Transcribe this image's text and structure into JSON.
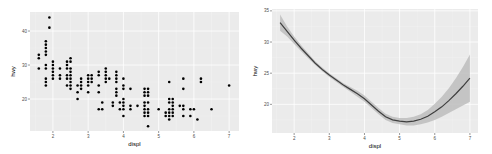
{
  "chart_data": [
    {
      "type": "scatter",
      "title": "",
      "xlabel": "displ",
      "ylabel": "hwy",
      "xlim": [
        1.35,
        7.28
      ],
      "ylim": [
        10.6,
        45.6
      ],
      "xticks": [
        2,
        3,
        4,
        5,
        6,
        7
      ],
      "yticks": [
        20,
        30,
        40
      ],
      "grid": true,
      "colors": {
        "panel": "#ebebeb",
        "grid_major": "#ffffff",
        "grid_minor": "#f5f5f5",
        "point": "#000000"
      },
      "points": [
        [
          1.6,
          33
        ],
        [
          1.6,
          32
        ],
        [
          1.6,
          29
        ],
        [
          1.8,
          29
        ],
        [
          1.8,
          26
        ],
        [
          1.8,
          25
        ],
        [
          1.8,
          24
        ],
        [
          1.8,
          36
        ],
        [
          1.8,
          35
        ],
        [
          1.8,
          34
        ],
        [
          1.8,
          33
        ],
        [
          1.8,
          37
        ],
        [
          1.8,
          30
        ],
        [
          1.9,
          44
        ],
        [
          1.9,
          41
        ],
        [
          2.0,
          31
        ],
        [
          2.0,
          30
        ],
        [
          2.0,
          29
        ],
        [
          2.0,
          28
        ],
        [
          2.0,
          27
        ],
        [
          2.0,
          26
        ],
        [
          2.2,
          29
        ],
        [
          2.2,
          27
        ],
        [
          2.2,
          26
        ],
        [
          2.4,
          31
        ],
        [
          2.4,
          30
        ],
        [
          2.4,
          27
        ],
        [
          2.4,
          26
        ],
        [
          2.4,
          24
        ],
        [
          2.4,
          29
        ],
        [
          2.5,
          32
        ],
        [
          2.5,
          31
        ],
        [
          2.5,
          29
        ],
        [
          2.5,
          28
        ],
        [
          2.5,
          27
        ],
        [
          2.5,
          26
        ],
        [
          2.5,
          25
        ],
        [
          2.5,
          24
        ],
        [
          2.5,
          23
        ],
        [
          2.7,
          24
        ],
        [
          2.7,
          22
        ],
        [
          2.7,
          20
        ],
        [
          2.8,
          26
        ],
        [
          2.8,
          25
        ],
        [
          2.8,
          24
        ],
        [
          2.8,
          23
        ],
        [
          3.0,
          27
        ],
        [
          3.0,
          26
        ],
        [
          3.0,
          25
        ],
        [
          3.0,
          24
        ],
        [
          3.0,
          22
        ],
        [
          3.1,
          27
        ],
        [
          3.1,
          26
        ],
        [
          3.1,
          25
        ],
        [
          3.3,
          28
        ],
        [
          3.3,
          27
        ],
        [
          3.3,
          24
        ],
        [
          3.3,
          22
        ],
        [
          3.3,
          17
        ],
        [
          3.4,
          19
        ],
        [
          3.4,
          17
        ],
        [
          3.5,
          29
        ],
        [
          3.5,
          28
        ],
        [
          3.5,
          27
        ],
        [
          3.5,
          26
        ],
        [
          3.5,
          25
        ],
        [
          3.6,
          26
        ],
        [
          3.7,
          19
        ],
        [
          3.7,
          18
        ],
        [
          3.8,
          28
        ],
        [
          3.8,
          27
        ],
        [
          3.8,
          26
        ],
        [
          3.8,
          25
        ],
        [
          3.8,
          23
        ],
        [
          3.8,
          22
        ],
        [
          3.8,
          21
        ],
        [
          3.9,
          19
        ],
        [
          3.9,
          17
        ],
        [
          4.0,
          26
        ],
        [
          4.0,
          24
        ],
        [
          4.0,
          23
        ],
        [
          4.0,
          20
        ],
        [
          4.0,
          19
        ],
        [
          4.0,
          18
        ],
        [
          4.0,
          17
        ],
        [
          4.0,
          15
        ],
        [
          4.2,
          23
        ],
        [
          4.2,
          18
        ],
        [
          4.2,
          17
        ],
        [
          4.4,
          18
        ],
        [
          4.6,
          23
        ],
        [
          4.6,
          22
        ],
        [
          4.6,
          21
        ],
        [
          4.6,
          19
        ],
        [
          4.6,
          18
        ],
        [
          4.6,
          17
        ],
        [
          4.6,
          16
        ],
        [
          4.6,
          15
        ],
        [
          4.7,
          23
        ],
        [
          4.7,
          22
        ],
        [
          4.7,
          21
        ],
        [
          4.7,
          19
        ],
        [
          4.7,
          17
        ],
        [
          4.7,
          16
        ],
        [
          4.7,
          15
        ],
        [
          4.7,
          12
        ],
        [
          5.0,
          17
        ],
        [
          5.2,
          16
        ],
        [
          5.2,
          15
        ],
        [
          5.3,
          25
        ],
        [
          5.3,
          20
        ],
        [
          5.3,
          19
        ],
        [
          5.3,
          17
        ],
        [
          5.3,
          16
        ],
        [
          5.3,
          15
        ],
        [
          5.3,
          14
        ],
        [
          5.4,
          20
        ],
        [
          5.4,
          19
        ],
        [
          5.4,
          18
        ],
        [
          5.4,
          17
        ],
        [
          5.4,
          16
        ],
        [
          5.4,
          15
        ],
        [
          5.6,
          18
        ],
        [
          5.7,
          26
        ],
        [
          5.7,
          23
        ],
        [
          5.7,
          18
        ],
        [
          5.7,
          17
        ],
        [
          5.7,
          15
        ],
        [
          5.9,
          17
        ],
        [
          5.9,
          15
        ],
        [
          6.0,
          17
        ],
        [
          6.1,
          14
        ],
        [
          6.2,
          26
        ],
        [
          6.2,
          25
        ],
        [
          6.5,
          17
        ],
        [
          7.0,
          24
        ]
      ]
    },
    {
      "type": "line",
      "title": "",
      "xlabel": "displ",
      "ylabel": "hwy",
      "xlim": [
        1.37,
        7.23
      ],
      "ylim": [
        15.4,
        35.3
      ],
      "xticks": [
        2,
        3,
        4,
        5,
        6,
        7
      ],
      "yticks": [
        20,
        25,
        30,
        35
      ],
      "grid": true,
      "colors": {
        "panel": "#ebebeb",
        "grid_major": "#ffffff",
        "grid_minor": "#f5f5f5",
        "line": "#3f3f3f",
        "ribbon": "#bdbdbd"
      },
      "smooth": {
        "x": [
          1.6,
          1.8,
          2.0,
          2.2,
          2.4,
          2.6,
          2.8,
          3.0,
          3.2,
          3.4,
          3.6,
          3.8,
          4.0,
          4.2,
          4.4,
          4.6,
          4.8,
          5.0,
          5.2,
          5.4,
          5.6,
          5.8,
          6.0,
          6.2,
          6.4,
          6.6,
          6.8,
          7.0
        ],
        "y": [
          33.1,
          31.7,
          30.3,
          29.0,
          27.8,
          26.6,
          25.6,
          24.7,
          23.9,
          23.1,
          22.4,
          21.7,
          20.9,
          19.9,
          18.9,
          18.0,
          17.5,
          17.3,
          17.2,
          17.3,
          17.6,
          18.1,
          18.8,
          19.6,
          20.6,
          21.7,
          22.9,
          24.2
        ],
        "ymin": [
          31.8,
          30.9,
          29.7,
          28.5,
          27.4,
          26.3,
          25.3,
          24.4,
          23.6,
          22.8,
          22.0,
          21.2,
          20.4,
          19.4,
          18.4,
          17.5,
          17.0,
          16.8,
          16.6,
          16.6,
          16.8,
          17.1,
          17.5,
          18.0,
          18.6,
          19.2,
          19.8,
          20.4
        ],
        "ymax": [
          34.4,
          32.5,
          30.9,
          29.5,
          28.2,
          26.9,
          25.9,
          25.0,
          24.2,
          23.4,
          22.8,
          22.2,
          21.4,
          20.4,
          19.4,
          18.5,
          18.0,
          17.8,
          17.8,
          18.0,
          18.4,
          19.1,
          20.1,
          21.2,
          22.6,
          24.2,
          26.0,
          28.0
        ]
      }
    }
  ]
}
